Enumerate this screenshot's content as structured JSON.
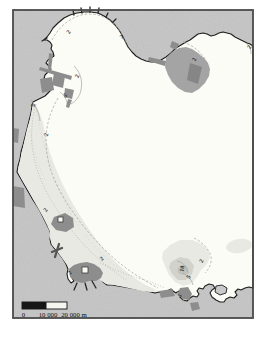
{
  "map": {
    "kind": "coastal-bay-contour-map",
    "colors": {
      "background": "#ffffff",
      "land": "#c9c9c9",
      "water": "#fcfcf6",
      "coastline": "#1c1c1c",
      "frame": "#4a4a4a",
      "urban_dark": "#8d8d8d",
      "patch_medium": "#a4a4a4",
      "patch_core": "#868686",
      "shallow_light": "#e9e9e3",
      "shallow_medium": "#d2d2cc",
      "shallow_core": "#c2c2bc",
      "scalebar_black": "#161616",
      "scalebar_white": "#f6f6f0"
    },
    "contour_labels": [
      {
        "value": "2",
        "x": 70,
        "y": 33,
        "rot": -55
      },
      {
        "value": "2",
        "x": 123,
        "y": 38,
        "rot": -45
      },
      {
        "value": "2",
        "x": 79,
        "y": 77,
        "rot": -65
      },
      {
        "value": "5",
        "x": 66,
        "y": 97,
        "rot": -25
      },
      {
        "value": "5",
        "x": 35,
        "y": 106,
        "rot": -70
      },
      {
        "value": "2",
        "x": 48,
        "y": 135,
        "rot": -78
      },
      {
        "value": "2",
        "x": 47,
        "y": 211,
        "rot": -55
      },
      {
        "value": "2",
        "x": 71,
        "y": 274,
        "rot": -45
      },
      {
        "value": "2",
        "x": 103,
        "y": 260,
        "rot": -40
      },
      {
        "value": "2",
        "x": 196,
        "y": 60,
        "rot": -70
      },
      {
        "value": "2",
        "x": 251,
        "y": 48,
        "rot": -60
      },
      {
        "value": "2",
        "x": 203,
        "y": 262,
        "rot": -60
      },
      {
        "value": "10",
        "x": 184,
        "y": 269,
        "rot": -80
      },
      {
        "value": "5",
        "x": 190,
        "y": 278,
        "rot": -55
      },
      {
        "value": "5",
        "x": 181,
        "y": 297,
        "rot": -40
      }
    ],
    "scale_bar": {
      "tick0": "0",
      "tick1": "10 000",
      "tick2": "20 000 m"
    }
  }
}
